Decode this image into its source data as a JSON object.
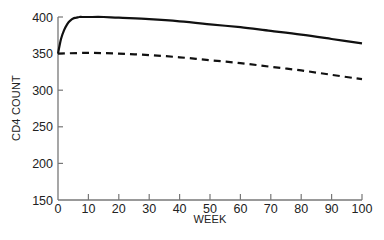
{
  "chart_data": {
    "type": "line",
    "title": "",
    "xlabel": "WEEK",
    "ylabel": "CD4 COUNT",
    "xlim": [
      0,
      100
    ],
    "ylim": [
      150,
      400
    ],
    "xticks": [
      0,
      10,
      20,
      30,
      40,
      50,
      60,
      70,
      80,
      90,
      100
    ],
    "yticks": [
      150,
      200,
      250,
      300,
      350,
      400
    ],
    "grid": false,
    "legend": null,
    "series": [
      {
        "name": "solid",
        "style": "solid",
        "color": "#111111",
        "x": [
          0,
          1,
          2,
          3,
          4,
          5,
          6,
          7,
          8,
          10,
          15,
          20,
          30,
          40,
          50,
          60,
          70,
          80,
          90,
          100
        ],
        "values": [
          350,
          370,
          382,
          390,
          395,
          398,
          399,
          400,
          400,
          400,
          400,
          399,
          397,
          394,
          390,
          386,
          381,
          376,
          370,
          364
        ]
      },
      {
        "name": "dashed",
        "style": "dashed",
        "color": "#111111",
        "x": [
          0,
          10,
          20,
          30,
          40,
          50,
          60,
          70,
          80,
          90,
          100
        ],
        "values": [
          350,
          351,
          350,
          348,
          345,
          341,
          337,
          332,
          327,
          321,
          315
        ]
      }
    ]
  }
}
